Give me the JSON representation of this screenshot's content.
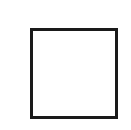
{
  "figure": {
    "type": "empty-square-outline",
    "background_color": "#ffffff",
    "canvas": {
      "width": 131,
      "height": 130
    },
    "shape": {
      "name": "square",
      "label": "",
      "fill_color": "#ffffff",
      "stroke_color": "#1a1a1a",
      "stroke_width": 3,
      "x": 30,
      "y": 28,
      "width": 88,
      "height": 91
    },
    "caption": ""
  }
}
